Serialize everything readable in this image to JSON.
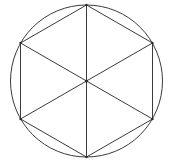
{
  "figure": {
    "title": "Regular hexagon inscribed in a circle",
    "background_color": "#ffffff",
    "stroke_color": "#3b3b3b",
    "stroke_width": 1,
    "canvas": {
      "width": 169,
      "height": 165
    },
    "circle": {
      "name": "circumscribed-circle",
      "center_x": 86.5,
      "center_y": 81,
      "radius": 76
    },
    "hexagon": {
      "name": "inscribed-hexagon",
      "sides": 6,
      "vertices": [
        {
          "label": "top",
          "x": 86.5,
          "y": 5
        },
        {
          "label": "upper-right",
          "x": 152.5,
          "y": 43
        },
        {
          "label": "lower-right",
          "x": 152.5,
          "y": 119
        },
        {
          "label": "bottom",
          "x": 86.5,
          "y": 157
        },
        {
          "label": "lower-left",
          "x": 20.5,
          "y": 119
        },
        {
          "label": "upper-left",
          "x": 20.5,
          "y": 43
        }
      ],
      "points_attr": "86.5,5 152.5,43 152.5,119 86.5,157 20.5,119 20.5,43"
    },
    "diagonals": [
      {
        "label": "vertical-diagonal",
        "x1": 86.5,
        "y1": 5,
        "x2": 86.5,
        "y2": 157
      },
      {
        "label": "upper-left-to-lower-right-diagonal",
        "x1": 20.5,
        "y1": 43,
        "x2": 152.5,
        "y2": 119
      },
      {
        "label": "upper-right-to-lower-left-diagonal",
        "x1": 152.5,
        "y1": 43,
        "x2": 20.5,
        "y2": 119
      }
    ],
    "center_point": {
      "label": "center",
      "x": 86.5,
      "y": 81,
      "radius": 1.6
    },
    "triangle_count": 6
  }
}
